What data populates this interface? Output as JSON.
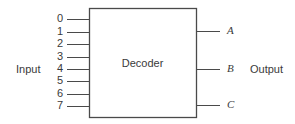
{
  "diagram": {
    "block": {
      "label": "Decoder",
      "x": 89,
      "y": 8,
      "width": 107,
      "height": 109,
      "stroke": "#4a4a4a",
      "fill": "#ffffff"
    },
    "input_group": {
      "label": "Input",
      "label_x": 16,
      "label_y": 64,
      "line_start_x": 67,
      "line_end_x": 89,
      "number_x": 53,
      "pins": [
        {
          "label": "0",
          "y": 19
        },
        {
          "label": "1",
          "y": 32
        },
        {
          "label": "2",
          "y": 44
        },
        {
          "label": "3",
          "y": 57
        },
        {
          "label": "4",
          "y": 69
        },
        {
          "label": "5",
          "y": 81
        },
        {
          "label": "6",
          "y": 94
        },
        {
          "label": "7",
          "y": 106
        }
      ]
    },
    "output_group": {
      "label": "Output",
      "label_x": 250,
      "label_y": 64,
      "line_start_x": 196,
      "line_end_x": 220,
      "label_offset_x": 227,
      "pins": [
        {
          "label": "A",
          "y": 31
        },
        {
          "label": "B",
          "y": 69
        },
        {
          "label": "C",
          "y": 105
        }
      ]
    },
    "colors": {
      "background": "#ffffff",
      "line": "#4a4a4a",
      "text": "#3a3a3a"
    }
  }
}
